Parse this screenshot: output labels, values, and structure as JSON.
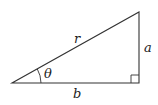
{
  "diagram": {
    "type": "right-triangle",
    "labels": {
      "hypotenuse": "r",
      "opposite": "a",
      "adjacent": "b",
      "angle": "θ"
    },
    "right_angle_marker": true,
    "colors": {
      "stroke": "#333333",
      "background": "#ffffff"
    }
  }
}
